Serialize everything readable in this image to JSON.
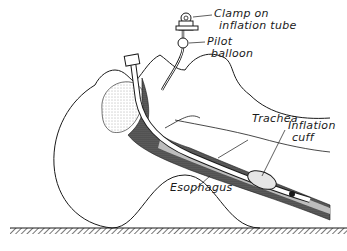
{
  "figure": {
    "type": "anatomical illustration",
    "colors": {
      "ink": "#1a1a1a",
      "background": "#ffffff",
      "stipple_dark": "#3a3a3a",
      "stipple_light": "#bdbdbd"
    }
  },
  "labels": {
    "clamp_line1": "Clamp on",
    "clamp_line2": "inflation tube",
    "pilot_line1": "Pilot",
    "pilot_line2": "balloon",
    "trachea": "Trachea",
    "inflation_line1": "Inflation",
    "inflation_line2": "cuff",
    "esophagus": "Esophagus"
  }
}
